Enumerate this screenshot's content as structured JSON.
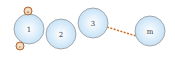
{
  "diagram": {
    "type": "linked-nodes",
    "nodes": [
      {
        "id": "n1",
        "label": "1",
        "cx": 29,
        "cy": 29,
        "r": 15
      },
      {
        "id": "n2",
        "label": "2",
        "cx": 61,
        "cy": 34,
        "r": 15
      },
      {
        "id": "n3",
        "label": "3",
        "cx": 93,
        "cy": 23,
        "r": 15
      },
      {
        "id": "nm",
        "label": "m",
        "cx": 150,
        "cy": 31,
        "r": 15
      }
    ],
    "connector": {
      "from": "n3",
      "to": "nm",
      "style": "dashed",
      "color": "#d2691e"
    },
    "markers": [
      {
        "id": "top-marker",
        "label": "a",
        "cx": 28,
        "cy": 11,
        "r": 4
      },
      {
        "id": "bottom-marker",
        "label": "r",
        "cx": 20,
        "cy": 46,
        "r": 4
      }
    ],
    "colors": {
      "node_fill_center": "#ffffff",
      "node_fill_edge": "#c6e2f7",
      "node_stroke": "#8a8a8a",
      "marker_fill": "#f3dcc3",
      "marker_stroke": "#b06a3b"
    }
  }
}
